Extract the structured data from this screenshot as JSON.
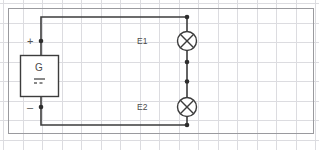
{
  "diagram": {
    "canvas": {
      "width": 319,
      "height": 150,
      "background": "#ffffff"
    },
    "grid": {
      "spacing": 19.5,
      "color": "#dcdce0",
      "visible": true
    },
    "frame": {
      "x": 8,
      "y": 8,
      "width": 306,
      "height": 126,
      "color": "#9a9a9e"
    },
    "wire": {
      "color": "#3c3c3c",
      "width": 1.6
    },
    "node": {
      "color": "#2e2e2e",
      "size": 3.6
    },
    "components": [
      {
        "id": "G",
        "type": "dc-generator",
        "label": "G",
        "symbol": "dc-source",
        "x": 20,
        "y": 55,
        "width": 38,
        "height": 42,
        "terminals": [
          {
            "name": "positive",
            "marker": "+"
          },
          {
            "name": "negative",
            "marker": "–"
          }
        ]
      },
      {
        "id": "E1",
        "type": "lamp",
        "label": "E1",
        "symbol": "circle-with-cross",
        "cx": 187,
        "cy": 41,
        "r": 9.5
      },
      {
        "id": "E2",
        "type": "lamp",
        "label": "E2",
        "symbol": "circle-with-cross",
        "cx": 187,
        "cy": 107,
        "r": 9.5
      }
    ],
    "terminals": {
      "plus": "+",
      "minus": "–"
    },
    "labels": {
      "generator": "G",
      "lamp_1": "E1",
      "lamp_2": "E2"
    }
  }
}
